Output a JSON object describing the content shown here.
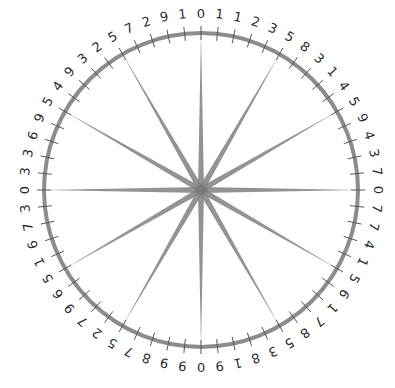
{
  "diagram": {
    "center": [
      201,
      190
    ],
    "radius": 157,
    "label_radius": 177,
    "tick_count": 60,
    "spoke_count": 12,
    "colors": {
      "rim": "#8c8c8c",
      "spoke": "#808080",
      "tick": "#555555",
      "hub": "#7a7a7a",
      "text": "#2b2b2b",
      "background": "#ffffff"
    },
    "digits": [
      0,
      1,
      1,
      2,
      3,
      5,
      8,
      3,
      1,
      4,
      5,
      9,
      4,
      3,
      7,
      0,
      7,
      7,
      4,
      1,
      5,
      6,
      1,
      7,
      8,
      5,
      3,
      8,
      1,
      9,
      0,
      9,
      9,
      8,
      7,
      5,
      2,
      7,
      9,
      6,
      5,
      1,
      6,
      7,
      3,
      0,
      3,
      3,
      6,
      9,
      5,
      4,
      9,
      3,
      2,
      5,
      7,
      2,
      9,
      1
    ]
  }
}
